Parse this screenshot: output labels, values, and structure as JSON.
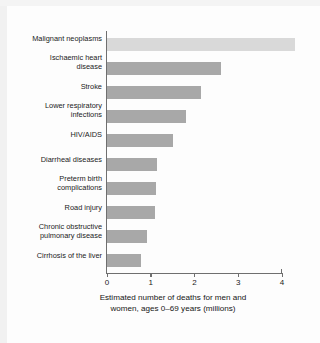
{
  "chart_data": {
    "type": "bar",
    "orientation": "horizontal",
    "title": "",
    "subtitle": "",
    "xlabel": "Estimated number of deaths for men and women, ages 0–69 years (millions)",
    "ylabel": "",
    "xlim": [
      0,
      4.6
    ],
    "xticks": [
      0,
      1,
      2,
      3,
      4
    ],
    "xtick_labels": [
      "0",
      "1",
      "2",
      "3",
      "4"
    ],
    "grid": false,
    "legend": false,
    "categories": [
      "Malignant neoplasms",
      "Ischaemic heart disease",
      "Stroke",
      "Lower respiratory infections",
      "HIV/AIDS",
      "Diarrheal diseases",
      "Preterm birth complications",
      "Road injury",
      "Chronic obstructive pulmonary disease",
      "Cirrhosis of the liver"
    ],
    "category_label_lines": [
      [
        "Malignant neoplasms"
      ],
      [
        "Ischaemic heart",
        "disease"
      ],
      [
        "Stroke"
      ],
      [
        "Lower respiratory",
        "infections"
      ],
      [
        "HIV/AIDS"
      ],
      [
        "Diarrheal diseases"
      ],
      [
        "Preterm birth",
        "complications"
      ],
      [
        "Road injury"
      ],
      [
        "Chronic obstructive",
        "pulmonary disease"
      ],
      [
        "Cirrhosis of the liver"
      ]
    ],
    "values": [
      4.3,
      2.6,
      2.15,
      1.8,
      1.5,
      1.15,
      1.12,
      1.1,
      0.92,
      0.78
    ],
    "bar_colors": [
      "#d9d9d9",
      "#a8a8a8",
      "#a8a8a8",
      "#a8a8a8",
      "#a8a8a8",
      "#a8a8a8",
      "#a8a8a8",
      "#a8a8a8",
      "#a8a8a8",
      "#a8a8a8"
    ]
  },
  "caption": {
    "line1": "Estimated number of deaths for men and",
    "line2": "women, ages 0–69 years (millions)"
  },
  "colors": {
    "background": "#fdfdfd",
    "axis": "#6f6f6f",
    "text": "#1b1b1b",
    "bar_default": "#a8a8a8",
    "bar_highlight": "#d9d9d9"
  }
}
